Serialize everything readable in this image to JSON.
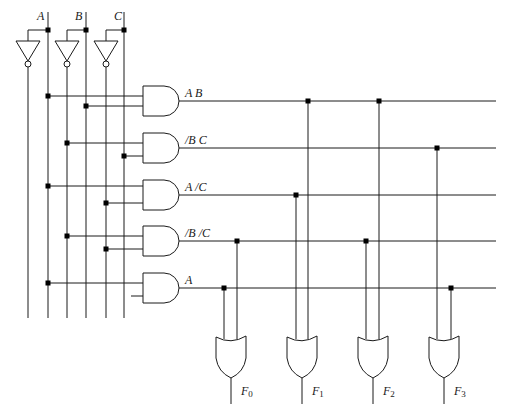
{
  "inputs": [
    {
      "name": "A",
      "label": "A"
    },
    {
      "name": "B",
      "label": "B"
    },
    {
      "name": "C",
      "label": "C"
    }
  ],
  "product_terms": [
    {
      "id": "ab",
      "label": "A B"
    },
    {
      "id": "nb_c",
      "label": "/B C"
    },
    {
      "id": "a_nc",
      "label": "A /C"
    },
    {
      "id": "nb_nc",
      "label": "/B /C"
    },
    {
      "id": "a",
      "label": "A"
    }
  ],
  "outputs": [
    {
      "id": "F0",
      "base": "F",
      "sub": "0",
      "terms": [
        "A",
        "/B /C"
      ]
    },
    {
      "id": "F1",
      "base": "F",
      "sub": "1",
      "terms": [
        "A /C",
        "A B"
      ]
    },
    {
      "id": "F2",
      "base": "F",
      "sub": "2",
      "terms": [
        "/B /C",
        "A B"
      ]
    },
    {
      "id": "F3",
      "base": "F",
      "sub": "3",
      "terms": [
        "/B C",
        "A"
      ]
    }
  ],
  "colors": {
    "line": "#1a1a1a",
    "junction": "#000000",
    "background": "#ffffff"
  }
}
